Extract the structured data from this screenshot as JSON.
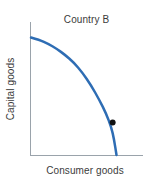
{
  "chart_data": {
    "type": "line",
    "title": "Country B",
    "xlabel": "Consumer goods",
    "ylabel": "Capital goods",
    "grid": false,
    "legend": null,
    "axis_ticks": [],
    "xlim": [
      0,
      1
    ],
    "ylim": [
      0,
      1
    ],
    "series": [
      {
        "name": "Production possibilities frontier",
        "color": "#2E6DB4",
        "linewidth": 2.5,
        "x": [
          0.0,
          0.1,
          0.2,
          0.3,
          0.4,
          0.5,
          0.6,
          0.7,
          0.8,
          0.88,
          0.94,
          0.97,
          1.0
        ],
        "y": [
          0.94,
          0.92,
          0.89,
          0.85,
          0.8,
          0.74,
          0.66,
          0.56,
          0.44,
          0.33,
          0.22,
          0.13,
          0.0
        ]
      }
    ],
    "annotations": [
      {
        "name": "production-point",
        "kind": "point",
        "x": 0.955,
        "y": 0.26,
        "color": "#111111",
        "marker": "filled-circle",
        "size": 6,
        "label": ""
      }
    ]
  },
  "chart": {
    "title": "Country B",
    "xlabel": "Consumer goods",
    "ylabel": "Capital goods",
    "curve_color": "#2E6DB4",
    "point_color": "#111111",
    "axis_color": "#9aa3ab",
    "background": "#ffffff"
  }
}
